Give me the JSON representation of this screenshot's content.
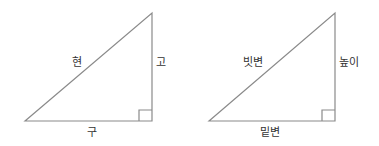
{
  "diagrams": [
    {
      "name": "traditional-terms",
      "hypotenuse": "현",
      "height": "고",
      "base": "구"
    },
    {
      "name": "modern-terms",
      "hypotenuse": "빗변",
      "height": "높이",
      "base": "밑변"
    }
  ],
  "colors": {
    "line": "#8a8a8a",
    "text": "#333333"
  }
}
